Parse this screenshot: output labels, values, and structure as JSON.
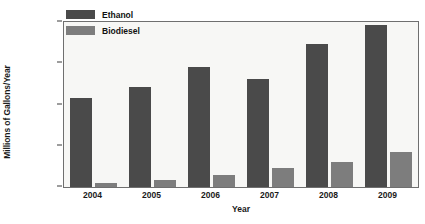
{
  "chart_data": {
    "type": "bar",
    "title": "",
    "subtitle": "",
    "xlabel": "Year",
    "ylabel": "Millions of Gallons/Year",
    "categories": [
      "2004",
      "2005",
      "2006",
      "2007",
      "2008",
      "2009"
    ],
    "series": [
      {
        "name": "Ethanol",
        "color": "#4a4a4a",
        "values": [
          10800,
          12100,
          14600,
          13100,
          17300,
          19600
        ]
      },
      {
        "name": "Biodiesel",
        "color": "#7d7d7d",
        "values": [
          480,
          850,
          1450,
          2300,
          3050,
          4300
        ]
      }
    ],
    "ylim": [
      0,
      20000
    ],
    "yticks": [
      0,
      5000,
      10000,
      15000,
      20000
    ],
    "ytick_labels": [
      "0",
      "5000",
      "10000",
      "15000",
      "20000"
    ],
    "grid": false,
    "legend_position": "upper-left-inside",
    "plot_background": "#f7f7f5",
    "frame_color": "#6f6f6f",
    "figure_background": "#ffffff"
  }
}
